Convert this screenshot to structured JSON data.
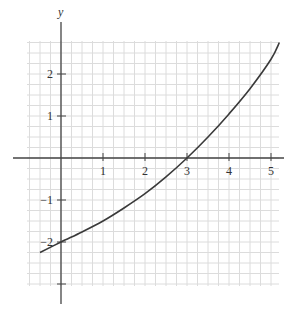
{
  "chart_data": {
    "type": "line",
    "title": "",
    "xlabel": "x",
    "ylabel": "y",
    "xlim": [
      -0.8,
      5.4
    ],
    "ylim": [
      -3.1,
      2.8
    ],
    "grid": true,
    "grid_minor_per_unit": 4,
    "x_ticks": [
      1,
      2,
      3,
      4,
      5
    ],
    "x_tick_labels": [
      "1",
      "2",
      "3",
      "4",
      "5"
    ],
    "y_ticks": [
      2,
      1,
      -1,
      -2,
      -3
    ],
    "y_tick_labels": [
      "2",
      "1",
      "−1",
      "−2",
      ""
    ],
    "series": [
      {
        "name": "curve",
        "x": [
          -0.5,
          0,
          0.5,
          1,
          1.5,
          2,
          2.5,
          3,
          3.5,
          4,
          4.5,
          5,
          5.2
        ],
        "y": [
          -2.25,
          -2.0,
          -1.76,
          -1.5,
          -1.19,
          -0.85,
          -0.45,
          0.0,
          0.5,
          1.05,
          1.65,
          2.35,
          2.75
        ]
      }
    ]
  },
  "colors": {
    "grid": "#dcdcdc",
    "axis": "#444444",
    "curve": "#3a3a3a"
  }
}
